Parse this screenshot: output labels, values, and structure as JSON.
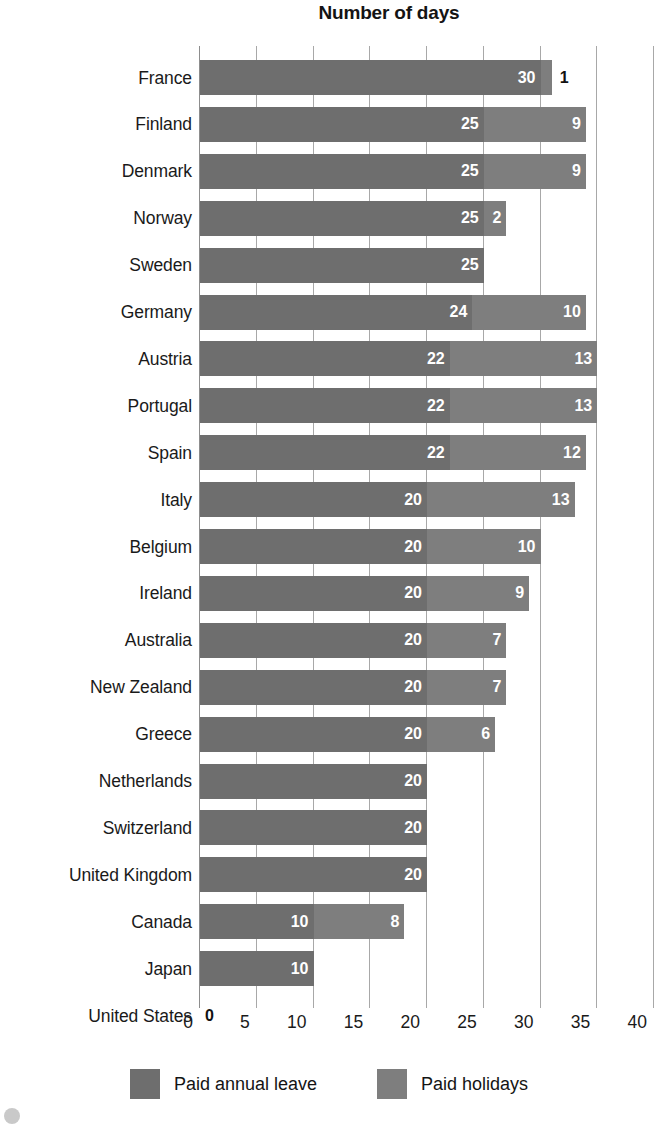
{
  "chart_data": {
    "type": "bar",
    "orientation": "horizontal",
    "stacked": true,
    "title": "Number of days",
    "xlabel": "",
    "ylabel": "",
    "xlim": [
      0,
      40
    ],
    "xticks": [
      0,
      5,
      10,
      15,
      20,
      25,
      30,
      35,
      40
    ],
    "tick_labels": [
      "0",
      "5",
      "10",
      "15",
      "20",
      "25",
      "30",
      "35",
      "40"
    ],
    "grid": true,
    "legend_position": "bottom",
    "categories": [
      "France",
      "Finland",
      "Denmark",
      "Norway",
      "Sweden",
      "Germany",
      "Austria",
      "Portugal",
      "Spain",
      "Italy",
      "Belgium",
      "Ireland",
      "Australia",
      "New Zealand",
      "Greece",
      "Netherlands",
      "Switzerland",
      "United Kingdom",
      "Canada",
      "Japan",
      "United States"
    ],
    "series": [
      {
        "name": "Paid annual leave",
        "color": "#6e6e6e",
        "values": [
          30,
          25,
          25,
          25,
          25,
          24,
          22,
          22,
          22,
          20,
          20,
          20,
          20,
          20,
          20,
          20,
          20,
          20,
          10,
          10,
          0
        ]
      },
      {
        "name": "Paid holidays",
        "color": "#7e7e7e",
        "values": [
          1,
          9,
          9,
          2,
          0,
          10,
          13,
          13,
          12,
          13,
          10,
          9,
          7,
          7,
          6,
          0,
          0,
          0,
          8,
          0,
          0
        ]
      }
    ],
    "rows": [
      {
        "label": "France",
        "annual": 30,
        "annual_label": "30",
        "holiday": 1,
        "holiday_label": "1",
        "holiday_label_outside": true
      },
      {
        "label": "Finland",
        "annual": 25,
        "annual_label": "25",
        "holiday": 9,
        "holiday_label": "9",
        "holiday_label_outside": false
      },
      {
        "label": "Denmark",
        "annual": 25,
        "annual_label": "25",
        "holiday": 9,
        "holiday_label": "9",
        "holiday_label_outside": false
      },
      {
        "label": "Norway",
        "annual": 25,
        "annual_label": "25",
        "holiday": 2,
        "holiday_label": "2",
        "holiday_label_outside": false
      },
      {
        "label": "Sweden",
        "annual": 25,
        "annual_label": "25",
        "holiday": 0,
        "holiday_label": "",
        "holiday_label_outside": false
      },
      {
        "label": "Germany",
        "annual": 24,
        "annual_label": "24",
        "holiday": 10,
        "holiday_label": "10",
        "holiday_label_outside": false
      },
      {
        "label": "Austria",
        "annual": 22,
        "annual_label": "22",
        "holiday": 13,
        "holiday_label": "13",
        "holiday_label_outside": false
      },
      {
        "label": "Portugal",
        "annual": 22,
        "annual_label": "22",
        "holiday": 13,
        "holiday_label": "13",
        "holiday_label_outside": false
      },
      {
        "label": "Spain",
        "annual": 22,
        "annual_label": "22",
        "holiday": 12,
        "holiday_label": "12",
        "holiday_label_outside": false
      },
      {
        "label": "Italy",
        "annual": 20,
        "annual_label": "20",
        "holiday": 13,
        "holiday_label": "13",
        "holiday_label_outside": false
      },
      {
        "label": "Belgium",
        "annual": 20,
        "annual_label": "20",
        "holiday": 10,
        "holiday_label": "10",
        "holiday_label_outside": false
      },
      {
        "label": "Ireland",
        "annual": 20,
        "annual_label": "20",
        "holiday": 9,
        "holiday_label": "9",
        "holiday_label_outside": false
      },
      {
        "label": "Australia",
        "annual": 20,
        "annual_label": "20",
        "holiday": 7,
        "holiday_label": "7",
        "holiday_label_outside": false
      },
      {
        "label": "New Zealand",
        "annual": 20,
        "annual_label": "20",
        "holiday": 7,
        "holiday_label": "7",
        "holiday_label_outside": false
      },
      {
        "label": "Greece",
        "annual": 20,
        "annual_label": "20",
        "holiday": 6,
        "holiday_label": "6",
        "holiday_label_outside": false
      },
      {
        "label": "Netherlands",
        "annual": 20,
        "annual_label": "20",
        "holiday": 0,
        "holiday_label": "",
        "holiday_label_outside": false
      },
      {
        "label": "Switzerland",
        "annual": 20,
        "annual_label": "20",
        "holiday": 0,
        "holiday_label": "",
        "holiday_label_outside": false
      },
      {
        "label": "United Kingdom",
        "annual": 20,
        "annual_label": "20",
        "holiday": 0,
        "holiday_label": "",
        "holiday_label_outside": false
      },
      {
        "label": "Canada",
        "annual": 10,
        "annual_label": "10",
        "holiday": 8,
        "holiday_label": "8",
        "holiday_label_outside": false
      },
      {
        "label": "Japan",
        "annual": 10,
        "annual_label": "10",
        "holiday": 0,
        "holiday_label": "",
        "holiday_label_outside": false
      },
      {
        "label": "United States",
        "annual": 0,
        "annual_label": "0",
        "holiday": 0,
        "holiday_label": "",
        "holiday_label_outside": false
      }
    ]
  },
  "legend": {
    "items": [
      {
        "label": "Paid annual leave",
        "color": "#6e6e6e"
      },
      {
        "label": "Paid holidays",
        "color": "#7e7e7e"
      }
    ]
  },
  "colors": {
    "annual_leave": "#6e6e6e",
    "paid_holidays": "#7e7e7e",
    "gridline": "#a8a8a8",
    "text": "#1a1a1a",
    "background": "#ffffff"
  }
}
